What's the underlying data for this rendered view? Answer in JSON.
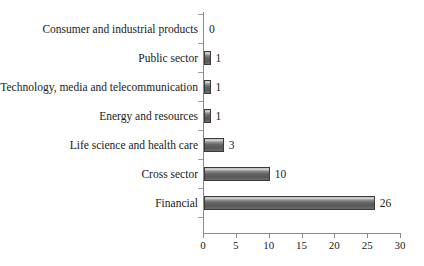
{
  "chart_data": {
    "type": "bar",
    "orientation": "horizontal",
    "title": "",
    "subtitle": "",
    "xlabel": "",
    "ylabel": "",
    "xlim": [
      0,
      30
    ],
    "xticks": [
      0,
      5,
      10,
      15,
      20,
      25,
      30
    ],
    "grid": false,
    "legend": null,
    "categories": [
      "Consumer and industrial products",
      "Public sector",
      "Technology, media and telecommunication",
      "Energy and resources",
      "Life science and health care",
      "Cross sector",
      "Financial"
    ],
    "values": [
      0,
      1,
      1,
      1,
      3,
      10,
      26
    ],
    "value_labels": [
      "0",
      "1",
      "1",
      "1",
      "3",
      "10",
      "26"
    ],
    "bar_color": "#6b6b6b",
    "bar_border_color": "#3a3a3a",
    "axis_color": "#8a8a8a",
    "background_color": "#ffffff",
    "text_color": "#1a1a1a"
  }
}
